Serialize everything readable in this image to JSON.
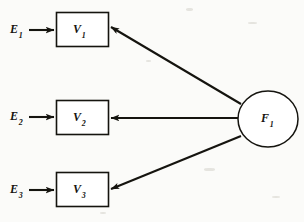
{
  "diagram": {
    "type": "path-diagram",
    "background_color": "#fbfbf9",
    "stroke_color": "#15140f",
    "latent_variables": [
      {
        "id": "F1",
        "symbol": "F",
        "subscript": "1",
        "shape": "ellipse",
        "cx": 268,
        "cy": 119,
        "rx": 30,
        "ry": 28
      }
    ],
    "observed_variables": [
      {
        "id": "V1",
        "symbol": "V",
        "subscript": "1",
        "shape": "rectangle",
        "x": 56,
        "y": 12,
        "width": 52,
        "height": 34
      },
      {
        "id": "V2",
        "symbol": "V",
        "subscript": "2",
        "shape": "rectangle",
        "x": 56,
        "y": 100,
        "width": 52,
        "height": 34
      },
      {
        "id": "V3",
        "symbol": "V",
        "subscript": "3",
        "shape": "rectangle",
        "x": 56,
        "y": 172,
        "width": 52,
        "height": 34
      }
    ],
    "error_terms": [
      {
        "id": "E1",
        "symbol": "E",
        "subscript": "1",
        "target": "V1"
      },
      {
        "id": "E2",
        "symbol": "E",
        "subscript": "2",
        "target": "V2"
      },
      {
        "id": "E3",
        "symbol": "E",
        "subscript": "3",
        "target": "V3"
      }
    ],
    "paths": [
      {
        "from": "F1",
        "to": "V1",
        "style": "single-headed-arrow"
      },
      {
        "from": "F1",
        "to": "V2",
        "style": "single-headed-arrow"
      },
      {
        "from": "F1",
        "to": "V3",
        "style": "single-headed-arrow"
      },
      {
        "from": "E1",
        "to": "V1",
        "style": "single-headed-arrow"
      },
      {
        "from": "E2",
        "to": "V2",
        "style": "single-headed-arrow"
      },
      {
        "from": "E3",
        "to": "V3",
        "style": "single-headed-arrow"
      }
    ]
  }
}
